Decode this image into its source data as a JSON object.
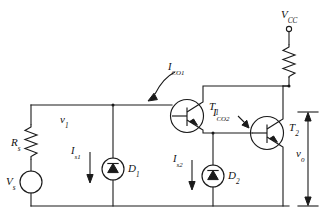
{
  "diagram": {
    "type": "electronic-schematic"
  },
  "labels": {
    "source_voltage": "V",
    "source_voltage_sub": "s",
    "source_resistor": "R",
    "source_resistor_sub": "s",
    "input_voltage": "v",
    "input_voltage_sub": "1",
    "supply": "V",
    "supply_sub": "CC",
    "output_voltage": "v",
    "output_voltage_sub": "o",
    "transistor1": "T",
    "transistor1_sub": "1",
    "transistor2": "T",
    "transistor2_sub": "2",
    "diode1": "D",
    "diode1_sub": "1",
    "diode2": "D",
    "diode2_sub": "2",
    "current_s1": "I",
    "current_s1_sub": "s1",
    "current_s2": "I",
    "current_s2_sub": "s2",
    "current_co1": "I",
    "current_co1_sub": "CO1",
    "current_co2": "I",
    "current_co2_sub": "CO2"
  },
  "components": [
    {
      "name": "source-vs",
      "kind": "voltage-source",
      "label": "Vs"
    },
    {
      "name": "resistor-rs",
      "kind": "resistor",
      "label": "Rs"
    },
    {
      "name": "resistor-rc",
      "kind": "resistor",
      "label": ""
    },
    {
      "name": "diode-d1",
      "kind": "diode-current-source",
      "label": "D1"
    },
    {
      "name": "diode-d2",
      "kind": "diode-current-source",
      "label": "D2"
    },
    {
      "name": "transistor-t1",
      "kind": "pnp-transistor",
      "label": "T1"
    },
    {
      "name": "transistor-t2",
      "kind": "pnp-transistor",
      "label": "T2"
    },
    {
      "name": "terminal-vcc",
      "kind": "open-terminal",
      "label": "VCC"
    }
  ],
  "colors": {
    "ink": "#1a1a1a",
    "background": "#ffffff"
  }
}
